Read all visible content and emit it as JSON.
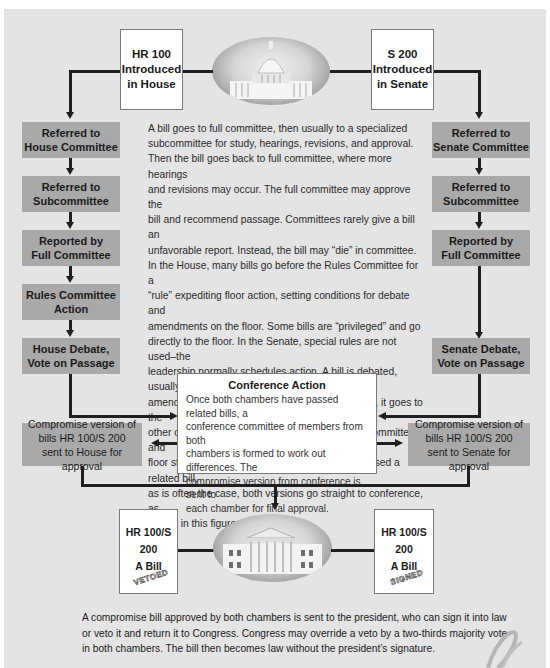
{
  "top": {
    "house_intro": "HR 100\nIntroduced\nin House",
    "senate_intro": "S 200\nIntroduced\nin Senate",
    "capitol_image": "capitol-building"
  },
  "house_steps": [
    "Referred to\nHouse Committee",
    "Referred to\nSubcommittee",
    "Reported by\nFull Committee",
    "Rules Committee\nAction",
    "House Debate,\nVote on Passage"
  ],
  "senate_steps": [
    "Referred to\nSenate Committee",
    "Referred to\nSubcommittee",
    "Reported by\nFull Committee",
    "Senate Debate,\nVote on Passage"
  ],
  "center_text": [
    "A bill goes to full committee, then usually to a specialized",
    "subcommittee for study, hearings, revisions, and approval.",
    "Then the bill goes back to full committee, where more hearings",
    "and revisions may occur. The full committee may approve the",
    "bill and recommend passage. Committees rarely give a bill an",
    "unfavorable report. Instead, the bill may “die” in committee.",
    "In the House, many bills go before the Rules Committee for a",
    "“rule” expediting floor action, setting conditions for debate and",
    "amendments on the floor. Some bills are “privileged” and go",
    "directly to the floor. In the Senate, special rules are not used–the",
    "leadership normally schedules action. A bill is debated, usually",
    "amended, and then passed or defeated. If passed, it goes to the",
    "other chamber to follow the same route through committee and",
    "floor stages. If the other chamber has already passed a related bill,",
    "as is often the case, both versions go straight to conference, as",
    "shown in this figure."
  ],
  "conference": {
    "title": "Conference Action",
    "lines": [
      "Once both chambers have passed related bills, a",
      "conference committee of members from both",
      "chambers is formed to work out differences. The",
      "compromise version from conference is sent to",
      "each chamber for final approval."
    ]
  },
  "compromise": {
    "house": "Compromise version of\nbills HR 100/S 200\nsent to House for approval",
    "senate": "Compromise version of\nbills HR 100/S 200\nsent to Senate for approval"
  },
  "president": {
    "left_bill": "HR 100/S 200\nA Bill",
    "left_stamp": "VETOED",
    "right_bill": "HR 100/S 200\nA Bill",
    "right_stamp": "SIGNED",
    "white_house_image": "white-house"
  },
  "footer_text": [
    "A compromise bill approved by both chambers is sent to the president, who can sign it into law",
    "or veto it and return it to Congress. Congress may override a veto by a two-thirds majority vote",
    "in both chambers. The bill then becomes law without the president’s signature."
  ],
  "colors": {
    "background": "#e4e4e4",
    "step_box": "#a9a9a9",
    "line": "#1f1f1f"
  }
}
